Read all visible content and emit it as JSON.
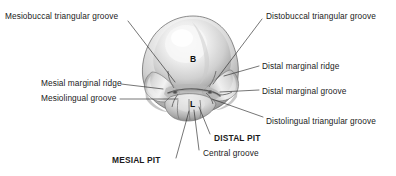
{
  "figure": {
    "background_color": "#ffffff",
    "text_color": "#1b1b1b"
  },
  "cusp_markers": [
    {
      "id": "buccal",
      "letter": "B",
      "x": 190,
      "y": 58
    },
    {
      "id": "lingual",
      "letter": "L",
      "x": 190,
      "y": 103
    }
  ],
  "labels": {
    "mesiobuccal_triangular_groove": "Mesiobuccal triangular groove",
    "mesial_marginal_ridge": "Mesial marginal ridge",
    "mesiolingual_groove": "Mesiolingual groove",
    "mesial_pit": "MESIAL PIT",
    "distobuccal_triangular_groove": "Distobuccal triangular groove",
    "distal_marginal_ridge": "Distal marginal ridge",
    "distal_marginal_groove": "Distal marginal groove",
    "distolingual_triangular_groove": "Distolingual triangular groove",
    "distal_pit": "DISTAL PIT",
    "central_groove": "Central groove"
  },
  "callouts": [
    {
      "id": "mesiobuccal-triangular-groove",
      "side": "left",
      "bold": false,
      "text_x": 5,
      "text_y": 11,
      "leader": [
        [
          128,
          21
        ],
        [
          175,
          82
        ]
      ]
    },
    {
      "id": "mesial-marginal-ridge",
      "side": "left",
      "bold": false,
      "text_x": 41,
      "text_y": 78,
      "leader": [
        [
          121,
          84
        ],
        [
          163,
          89
        ]
      ]
    },
    {
      "id": "mesiolingual-groove",
      "side": "left",
      "bold": false,
      "text_x": 41,
      "text_y": 93,
      "leader": [
        [
          120,
          99
        ],
        [
          178,
          99
        ]
      ]
    },
    {
      "id": "mesial-pit",
      "side": "left",
      "bold": true,
      "text_x": 112,
      "text_y": 155,
      "leader": [
        [
          176,
          158
        ],
        [
          189,
          111
        ]
      ]
    },
    {
      "id": "distobuccal-triangular-groove",
      "side": "right",
      "bold": false,
      "text_x": 266,
      "text_y": 11,
      "leader": [
        [
          262,
          19
        ],
        [
          213,
          84
        ]
      ]
    },
    {
      "id": "distal-marginal-ridge",
      "side": "right",
      "bold": false,
      "text_x": 262,
      "text_y": 61,
      "leader": [
        [
          259,
          66
        ],
        [
          224,
          76
        ]
      ]
    },
    {
      "id": "distal-marginal-groove",
      "side": "right",
      "bold": false,
      "text_x": 262,
      "text_y": 86,
      "leader": [
        [
          259,
          90
        ],
        [
          220,
          92
        ]
      ]
    },
    {
      "id": "distolingual-triangular-groove",
      "side": "right",
      "bold": false,
      "text_x": 266,
      "text_y": 116,
      "leader": [
        [
          263,
          117
        ],
        [
          212,
          99
        ]
      ]
    },
    {
      "id": "distal-pit",
      "side": "right",
      "bold": true,
      "text_x": 214,
      "text_y": 133,
      "leader": [
        [
          210,
          134
        ],
        [
          199,
          107
        ]
      ]
    },
    {
      "id": "central-groove",
      "side": "right",
      "bold": false,
      "text_x": 203,
      "text_y": 148,
      "leader": [
        [
          199,
          150
        ],
        [
          194,
          110
        ]
      ]
    }
  ],
  "line_color": "#2b2b2b"
}
